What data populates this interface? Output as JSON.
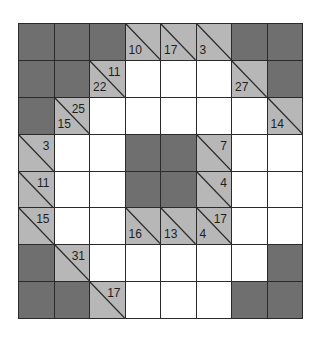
{
  "puzzle": {
    "type": "kakuro",
    "rows": 8,
    "cols": 8,
    "colors": {
      "block": "#6f6f6f",
      "clue": "#b7b7b7",
      "entry": "#ffffff",
      "line": "#2a2a2a"
    },
    "cells": [
      [
        {
          "t": "D"
        },
        {
          "t": "D"
        },
        {
          "t": "D"
        },
        {
          "t": "C",
          "down": "10"
        },
        {
          "t": "C",
          "down": "17"
        },
        {
          "t": "C",
          "down": "3"
        },
        {
          "t": "D"
        },
        {
          "t": "D"
        }
      ],
      [
        {
          "t": "D"
        },
        {
          "t": "D"
        },
        {
          "t": "C",
          "across": "11",
          "down": "22"
        },
        {
          "t": "W"
        },
        {
          "t": "W"
        },
        {
          "t": "W"
        },
        {
          "t": "C",
          "down": "27"
        },
        {
          "t": "D"
        }
      ],
      [
        {
          "t": "D"
        },
        {
          "t": "C",
          "across": "25",
          "down": "15"
        },
        {
          "t": "W"
        },
        {
          "t": "W"
        },
        {
          "t": "W"
        },
        {
          "t": "W"
        },
        {
          "t": "W"
        },
        {
          "t": "C",
          "down": "14"
        }
      ],
      [
        {
          "t": "C",
          "across": "3"
        },
        {
          "t": "W"
        },
        {
          "t": "W"
        },
        {
          "t": "D"
        },
        {
          "t": "D"
        },
        {
          "t": "C",
          "across": "7"
        },
        {
          "t": "W"
        },
        {
          "t": "W"
        }
      ],
      [
        {
          "t": "C",
          "across": "11"
        },
        {
          "t": "W"
        },
        {
          "t": "W"
        },
        {
          "t": "D"
        },
        {
          "t": "D"
        },
        {
          "t": "C",
          "across": "4"
        },
        {
          "t": "W"
        },
        {
          "t": "W"
        }
      ],
      [
        {
          "t": "C",
          "across": "15"
        },
        {
          "t": "W"
        },
        {
          "t": "W"
        },
        {
          "t": "C",
          "down": "16"
        },
        {
          "t": "C",
          "down": "13"
        },
        {
          "t": "C",
          "across": "17",
          "down": "4"
        },
        {
          "t": "W"
        },
        {
          "t": "W"
        }
      ],
      [
        {
          "t": "D"
        },
        {
          "t": "C",
          "across": "31"
        },
        {
          "t": "W"
        },
        {
          "t": "W"
        },
        {
          "t": "W"
        },
        {
          "t": "W"
        },
        {
          "t": "W"
        },
        {
          "t": "D"
        }
      ],
      [
        {
          "t": "D"
        },
        {
          "t": "D"
        },
        {
          "t": "C",
          "across": "17"
        },
        {
          "t": "W"
        },
        {
          "t": "W"
        },
        {
          "t": "W"
        },
        {
          "t": "D"
        },
        {
          "t": "D"
        }
      ]
    ]
  }
}
